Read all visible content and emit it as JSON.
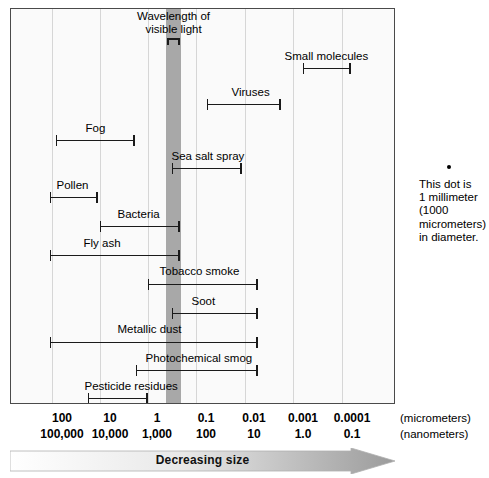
{
  "chart_data": {
    "type": "bar",
    "orientation": "horizontal-range",
    "title": "",
    "xlabel": "",
    "ylabel": "",
    "scale": "log",
    "x_axis": {
      "unit_primary": "(micrometers)",
      "unit_secondary": "(nanometers)",
      "ticks_micrometers": [
        "100",
        "10",
        "1",
        "0.1",
        "0.01",
        "0.001",
        "0.0001"
      ],
      "ticks_nanometers": [
        "100,000",
        "10,000",
        "1,000",
        "100",
        "10",
        "1.0",
        "0.1"
      ],
      "direction_label": "Decreasing size",
      "xlim_micrometers": [
        300,
        3e-05
      ]
    },
    "grid": true,
    "legend": "none",
    "highlight_band": {
      "label_line1": "Wavelength of",
      "label_line2": "visible light",
      "range_micrometers": [
        0.7,
        0.4
      ],
      "color": "#a8a8a8"
    },
    "series": [
      {
        "name": "Small molecules",
        "range_micrometers": [
          0.001,
          0.0001
        ]
      },
      {
        "name": "Viruses",
        "range_micrometers": [
          0.1,
          0.01
        ]
      },
      {
        "name": "Fog",
        "range_micrometers": [
          60,
          2
        ]
      },
      {
        "name": "Sea salt spray",
        "range_micrometers": [
          0.5,
          0.04
        ]
      },
      {
        "name": "Pollen",
        "range_micrometers": [
          100,
          10
        ]
      },
      {
        "name": "Bacteria",
        "range_micrometers": [
          10,
          0.3
        ]
      },
      {
        "name": "Fly ash",
        "range_micrometers": [
          100,
          0.5
        ]
      },
      {
        "name": "Tobacco smoke",
        "range_micrometers": [
          1,
          0.01
        ]
      },
      {
        "name": "Soot",
        "range_micrometers": [
          0.5,
          0.01
        ]
      },
      {
        "name": "Metallic dust",
        "range_micrometers": [
          100,
          0.01
        ]
      },
      {
        "name": "Photochemical smog",
        "range_micrometers": [
          2,
          0.01
        ]
      },
      {
        "name": "Pesticide residues",
        "range_micrometers": [
          10,
          1
        ]
      }
    ],
    "annotation": {
      "lines": [
        "This dot is",
        "1 millimeter",
        "(1000",
        "micrometers)",
        "in diameter."
      ]
    }
  },
  "axis": {
    "micrometers": [
      {
        "label": "100",
        "x": 62
      },
      {
        "label": "10",
        "x": 110
      },
      {
        "label": "1",
        "x": 157
      },
      {
        "label": "0.1",
        "x": 206
      },
      {
        "label": "0.01",
        "x": 254
      },
      {
        "label": "0.001",
        "x": 303
      },
      {
        "label": "0.0001",
        "x": 352
      }
    ],
    "nanometers": [
      {
        "label": "100,000",
        "x": 62
      },
      {
        "label": "10,000",
        "x": 110
      },
      {
        "label": "1,000",
        "x": 157
      },
      {
        "label": "100",
        "x": 206
      },
      {
        "label": "10",
        "x": 254
      },
      {
        "label": "1.0",
        "x": 303
      },
      {
        "label": "0.1",
        "x": 352
      }
    ],
    "unit_primary": "(micrometers)",
    "unit_secondary": "(nanometers)"
  },
  "band": {
    "title_line1": "Wavelength of",
    "title_line2": "visible light"
  },
  "arrow": {
    "label": "Decreasing size"
  },
  "note": {
    "line1": "This dot is",
    "line2": "1 millimeter",
    "line3": "(1000",
    "line4": "micrometers)",
    "line5": "in diameter."
  },
  "bars": [
    {
      "name": "Small molecules",
      "left": 303,
      "right": 351,
      "y": 63,
      "lx": 285,
      "ly": 50
    },
    {
      "name": "Viruses",
      "left": 207,
      "right": 281,
      "y": 99,
      "lx": 232,
      "ly": 86
    },
    {
      "name": "Fog",
      "left": 56,
      "right": 135,
      "y": 135,
      "lx": 86,
      "ly": 122
    },
    {
      "name": "Sea salt spray",
      "left": 172,
      "right": 242,
      "y": 163,
      "lx": 172,
      "ly": 150
    },
    {
      "name": "Pollen",
      "left": 50,
      "right": 98,
      "y": 192,
      "lx": 57,
      "ly": 179
    },
    {
      "name": "Bacteria",
      "left": 100,
      "right": 180,
      "y": 221,
      "lx": 118,
      "ly": 208
    },
    {
      "name": "Fly ash",
      "left": 50,
      "right": 180,
      "y": 250,
      "lx": 84,
      "ly": 237
    },
    {
      "name": "Tobacco smoke",
      "left": 148,
      "right": 258,
      "y": 279,
      "lx": 160,
      "ly": 265
    },
    {
      "name": "Soot",
      "left": 172,
      "right": 258,
      "y": 308,
      "lx": 192,
      "ly": 295
    },
    {
      "name": "Metallic dust",
      "left": 50,
      "right": 258,
      "y": 337,
      "lx": 118,
      "ly": 323
    },
    {
      "name": "Photochemical smog",
      "left": 136,
      "right": 258,
      "y": 365,
      "lx": 146,
      "ly": 352
    },
    {
      "name": "Pesticide residues",
      "left": 88,
      "right": 148,
      "y": 393,
      "lx": 85,
      "ly": 380
    }
  ],
  "gridlines_x": [
    52,
    100,
    148,
    196,
    245,
    293,
    342
  ],
  "light_band": {
    "left": 166,
    "width": 15
  }
}
